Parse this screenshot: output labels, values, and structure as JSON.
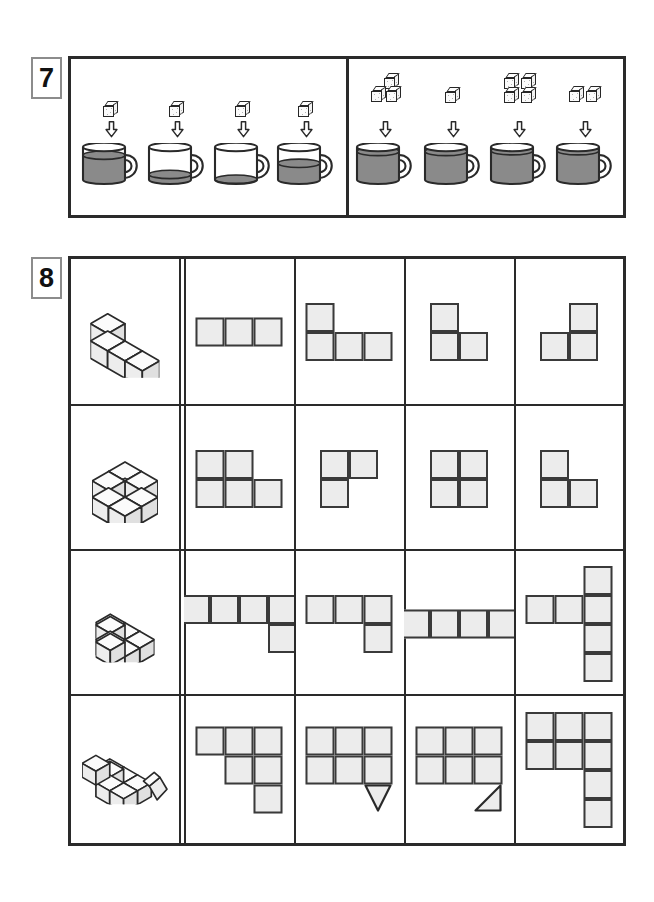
{
  "worksheet": {
    "page_background": "#ffffff",
    "ink_color": "#2a2a2a",
    "fill_color": "#ececec",
    "liquid_color": "#8a8a8a"
  },
  "exercises": [
    {
      "number": "7",
      "label": "7",
      "type": "sugar-cubes-into-mugs",
      "groups": [
        {
          "side": "left",
          "items": [
            {
              "cubes": 1,
              "cube_layout": "single",
              "mug_fill_percent": 78,
              "mug_label": "mug-1"
            },
            {
              "cubes": 1,
              "cube_layout": "single",
              "mug_fill_percent": 26,
              "mug_label": "mug-2"
            },
            {
              "cubes": 1,
              "cube_layout": "single",
              "mug_fill_percent": 13,
              "mug_label": "mug-3"
            },
            {
              "cubes": 1,
              "cube_layout": "single",
              "mug_fill_percent": 56,
              "mug_label": "mug-4"
            }
          ]
        },
        {
          "side": "right",
          "items": [
            {
              "cubes": 3,
              "cube_layout": "one-over-two",
              "mug_fill_percent": 88,
              "mug_label": "mug-5"
            },
            {
              "cubes": 1,
              "cube_layout": "single",
              "mug_fill_percent": 88,
              "mug_label": "mug-6"
            },
            {
              "cubes": 4,
              "cube_layout": "two-by-two",
              "mug_fill_percent": 90,
              "mug_label": "mug-7"
            },
            {
              "cubes": 2,
              "cube_layout": "two-side-by-side",
              "mug_fill_percent": 90,
              "mug_label": "mug-8"
            }
          ]
        }
      ]
    },
    {
      "number": "8",
      "label": "8",
      "type": "match-3d-stack-to-footprint",
      "columns": 5,
      "rows": [
        {
          "figure": {
            "name": "L-shaped stack of 4 cubes",
            "cube_count": 4,
            "cubes": [
              {
                "x": 0,
                "y": 0,
                "z": 0
              },
              {
                "x": 1,
                "y": 0,
                "z": 0
              },
              {
                "x": 2,
                "y": 0,
                "z": 0
              },
              {
                "x": 0,
                "y": 0,
                "z": 1
              }
            ]
          },
          "options": [
            {
              "name": "row-of-three",
              "cells": [
                [
                  0,
                  0
                ],
                [
                  1,
                  0
                ],
                [
                  2,
                  0
                ]
              ]
            },
            {
              "name": "L-three-plus-one-top-left",
              "cells": [
                [
                  0,
                  0
                ],
                [
                  0,
                  1
                ],
                [
                  1,
                  1
                ],
                [
                  2,
                  1
                ]
              ]
            },
            {
              "name": "vertical-two-plus-one-right",
              "cells": [
                [
                  0,
                  0
                ],
                [
                  0,
                  1
                ],
                [
                  1,
                  1
                ]
              ]
            },
            {
              "name": "one-top-right-plus-two-bottom",
              "cells": [
                [
                  1,
                  0
                ],
                [
                  0,
                  1
                ],
                [
                  1,
                  1
                ]
              ]
            }
          ]
        },
        {
          "figure": {
            "name": "2x2x2 block of cubes",
            "cube_count": 7,
            "cubes": [
              {
                "x": 0,
                "y": 0,
                "z": 0
              },
              {
                "x": 1,
                "y": 0,
                "z": 0
              },
              {
                "x": 0,
                "y": 1,
                "z": 0
              },
              {
                "x": 1,
                "y": 1,
                "z": 0
              },
              {
                "x": 0,
                "y": 0,
                "z": 1
              },
              {
                "x": 1,
                "y": 0,
                "z": 1
              },
              {
                "x": 0,
                "y": 1,
                "z": 1
              }
            ]
          },
          "options": [
            {
              "name": "P-shape-square-plus-bottom-right",
              "cells": [
                [
                  0,
                  0
                ],
                [
                  1,
                  0
                ],
                [
                  0,
                  1
                ],
                [
                  1,
                  1
                ],
                [
                  2,
                  1
                ]
              ]
            },
            {
              "name": "two-top-plus-one-bottom-left",
              "cells": [
                [
                  0,
                  0
                ],
                [
                  1,
                  0
                ],
                [
                  0,
                  1
                ]
              ]
            },
            {
              "name": "two-by-two-square",
              "cells": [
                [
                  0,
                  0
                ],
                [
                  1,
                  0
                ],
                [
                  0,
                  1
                ],
                [
                  1,
                  1
                ]
              ]
            },
            {
              "name": "one-top-left-plus-two-bottom",
              "cells": [
                [
                  0,
                  0
                ],
                [
                  0,
                  1
                ],
                [
                  1,
                  1
                ]
              ]
            }
          ]
        },
        {
          "figure": {
            "name": "staircase stack of cubes",
            "cube_count": 7,
            "cubes": [
              {
                "x": 0,
                "y": 0,
                "z": 0
              },
              {
                "x": 1,
                "y": 0,
                "z": 0
              },
              {
                "x": 2,
                "y": 0,
                "z": 0
              },
              {
                "x": 1,
                "y": 1,
                "z": 0
              },
              {
                "x": 2,
                "y": 1,
                "z": 0
              },
              {
                "x": 1,
                "y": 1,
                "z": 1
              },
              {
                "x": 2,
                "y": 2,
                "z": 1
              }
            ]
          },
          "options": [
            {
              "name": "four-across-plus-one-below-last",
              "cells": [
                [
                  0,
                  0
                ],
                [
                  1,
                  0
                ],
                [
                  2,
                  0
                ],
                [
                  3,
                  0
                ],
                [
                  3,
                  1
                ]
              ]
            },
            {
              "name": "three-across-plus-one-below-last",
              "cells": [
                [
                  0,
                  0
                ],
                [
                  1,
                  0
                ],
                [
                  2,
                  0
                ],
                [
                  2,
                  1
                ]
              ]
            },
            {
              "name": "four-across",
              "cells": [
                [
                  0,
                  0
                ],
                [
                  1,
                  0
                ],
                [
                  2,
                  0
                ],
                [
                  3,
                  0
                ]
              ]
            },
            {
              "name": "vertical-four-with-two-left-arm",
              "cells": [
                [
                  2,
                  0
                ],
                [
                  0,
                  1
                ],
                [
                  1,
                  1
                ],
                [
                  2,
                  1
                ],
                [
                  2,
                  2
                ],
                [
                  2,
                  3
                ]
              ]
            }
          ]
        },
        {
          "figure": {
            "name": "pyramid stack with detached cube",
            "cube_count": 7,
            "cubes": [
              {
                "x": 0,
                "y": 0,
                "z": 0
              },
              {
                "x": 1,
                "y": 0,
                "z": 0
              },
              {
                "x": 2,
                "y": 0,
                "z": 0
              },
              {
                "x": 1,
                "y": 1,
                "z": 0
              },
              {
                "x": 2,
                "y": 1,
                "z": 0
              },
              {
                "x": 1,
                "y": 1,
                "z": 1
              },
              {
                "x": 1,
                "y": 2,
                "z": 2
              }
            ],
            "detached_cube": true
          },
          "options": [
            {
              "name": "staircase-three-two-one",
              "cells": [
                [
                  0,
                  0
                ],
                [
                  1,
                  0
                ],
                [
                  2,
                  0
                ],
                [
                  1,
                  1
                ],
                [
                  2,
                  1
                ],
                [
                  2,
                  2
                ]
              ]
            },
            {
              "name": "three-by-two-plus-down-triangle",
              "cells": [
                [
                  0,
                  0
                ],
                [
                  1,
                  0
                ],
                [
                  2,
                  0
                ],
                [
                  0,
                  1
                ],
                [
                  1,
                  1
                ],
                [
                  2,
                  1
                ]
              ],
              "extra": "triangle-down-under-col3"
            },
            {
              "name": "three-by-two-plus-right-triangle",
              "cells": [
                [
                  0,
                  0
                ],
                [
                  1,
                  0
                ],
                [
                  2,
                  0
                ],
                [
                  0,
                  1
                ],
                [
                  1,
                  1
                ],
                [
                  2,
                  1
                ]
              ],
              "extra": "triangle-right-under-col3"
            },
            {
              "name": "three-by-two-plus-two-below-col3",
              "cells": [
                [
                  0,
                  0
                ],
                [
                  1,
                  0
                ],
                [
                  2,
                  0
                ],
                [
                  0,
                  1
                ],
                [
                  1,
                  1
                ],
                [
                  2,
                  1
                ],
                [
                  2,
                  2
                ],
                [
                  2,
                  3
                ]
              ]
            }
          ]
        }
      ]
    }
  ]
}
